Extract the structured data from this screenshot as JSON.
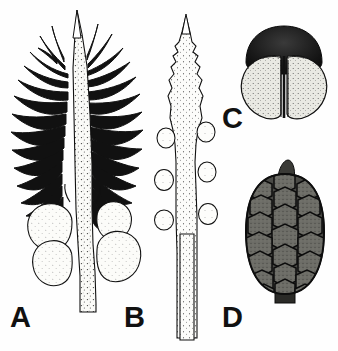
{
  "figure": {
    "type": "scientific-botanical-illustration",
    "background_color": "#fefefe",
    "ink_color": "#111111",
    "width": 338,
    "height": 351,
    "panel_count": 4
  },
  "panels": [
    {
      "id": "a",
      "label": "A",
      "subject": "bristly-cone-with-galls",
      "description": "Elongate spiny cone axis with radiating awn-like bracts and rounded basal galls",
      "fill": "#fbfbf8",
      "stroke": "#111111",
      "bristle_count": 26,
      "gall_count": 4
    },
    {
      "id": "b",
      "label": "B",
      "subject": "smooth-bud-shoot",
      "description": "Slender stippled shoot with pointed serrate apex, paired lateral nodules and long stalk",
      "fill": "#fcfcfa",
      "stroke": "#111111",
      "nodule_count": 6
    },
    {
      "id": "c",
      "label": "C",
      "subject": "bilobed-microsporophyll",
      "description": "Bilobed pale structure with dark domed cap and central vertical groove",
      "fill": "#e8e8e2",
      "cap_fill": "#1a1a1a",
      "stroke": "#111111"
    },
    {
      "id": "d",
      "label": "D",
      "subject": "mature-seed-cone",
      "description": "Dark ovoid cone with spirally arranged hexagonal scales, apical umbo and short peduncle",
      "fill": "#4a4a46",
      "scale_fill": "#6a6a64",
      "stroke": "#0d0d0d",
      "scale_rows": 8
    }
  ]
}
